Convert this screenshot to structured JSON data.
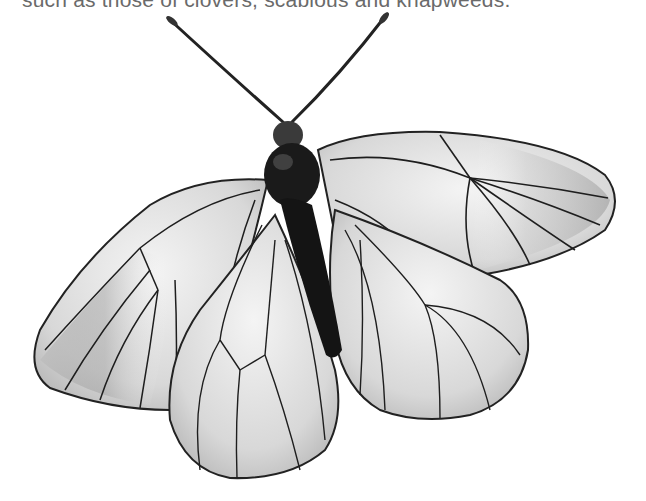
{
  "caption": {
    "text": "such as those of clovers, scabious and knapweeds.",
    "note": "partially cropped at top edge"
  },
  "image": {
    "subject": "black-veined white butterfly, top-down view, wings spread",
    "background": "#ffffff",
    "palette": {
      "wing": "#e6e6e6",
      "wing_shade": "#a8a8a8",
      "vein": "#1e1e1e",
      "body": "#141414",
      "antenna": "#222222"
    }
  }
}
